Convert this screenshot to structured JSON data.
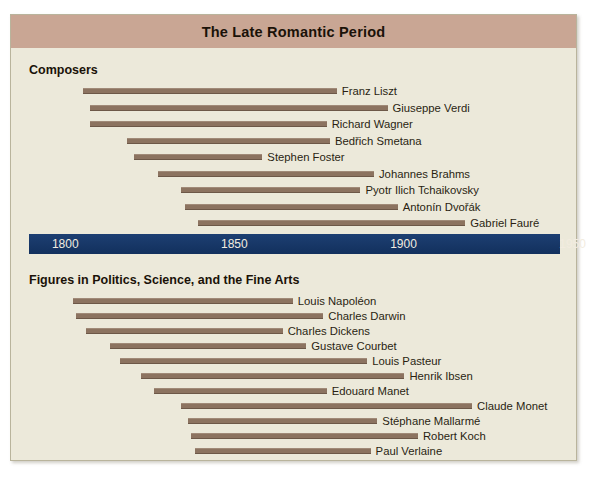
{
  "title": "The Late Romantic Period",
  "colors": {
    "title_banner": "#c9a694",
    "page_background": "#ece9da",
    "bar": "#8c7360",
    "axis_bar": "#173a6b",
    "axis_label": "#f2ece0",
    "text": "#1a1208"
  },
  "sections": [
    {
      "heading": "Composers"
    },
    {
      "heading": "Figures in Politics, Science, and the Fine Arts"
    }
  ],
  "axis": {
    "ticks": [
      "1800",
      "1850",
      "1900",
      "1950"
    ],
    "min": 1795,
    "max": 1952
  },
  "chart_data": {
    "type": "bar",
    "subtype": "gantt-timeline",
    "title": "The Late Romantic Period",
    "xlabel": "",
    "ylabel": "",
    "xlim": [
      1795,
      1952
    ],
    "grid": false,
    "legend": "none",
    "axis_ticks": [
      1800,
      1850,
      1900,
      1950
    ],
    "groups": [
      {
        "name": "Composers",
        "items": [
          {
            "label": "Franz Liszt",
            "start": 1811,
            "end": 1886
          },
          {
            "label": "Giuseppe Verdi",
            "start": 1813,
            "end": 1901
          },
          {
            "label": "Richard Wagner",
            "start": 1813,
            "end": 1883
          },
          {
            "label": "Bedřich Smetana",
            "start": 1824,
            "end": 1884
          },
          {
            "label": "Stephen Foster",
            "start": 1826,
            "end": 1864
          },
          {
            "label": "Johannes Brahms",
            "start": 1833,
            "end": 1897
          },
          {
            "label": "Pyotr Ilich Tchaikovsky",
            "start": 1840,
            "end": 1893
          },
          {
            "label": "Antonín Dvořák",
            "start": 1841,
            "end": 1904
          },
          {
            "label": "Gabriel Fauré",
            "start": 1845,
            "end": 1924
          }
        ]
      },
      {
        "name": "Figures in Politics, Science, and the Fine Arts",
        "items": [
          {
            "label": "Louis Napoléon",
            "start": 1808,
            "end": 1873
          },
          {
            "label": "Charles Darwin",
            "start": 1809,
            "end": 1882
          },
          {
            "label": "Charles Dickens",
            "start": 1812,
            "end": 1870
          },
          {
            "label": "Gustave Courbet",
            "start": 1819,
            "end": 1877
          },
          {
            "label": "Louis Pasteur",
            "start": 1822,
            "end": 1895
          },
          {
            "label": "Henrik Ibsen",
            "start": 1828,
            "end": 1906
          },
          {
            "label": "Edouard Manet",
            "start": 1832,
            "end": 1883
          },
          {
            "label": "Claude Monet",
            "start": 1840,
            "end": 1926
          },
          {
            "label": "Stéphane Mallarmé",
            "start": 1842,
            "end": 1898
          },
          {
            "label": "Robert Koch",
            "start": 1843,
            "end": 1910
          },
          {
            "label": "Paul Verlaine",
            "start": 1844,
            "end": 1896
          }
        ]
      }
    ]
  }
}
